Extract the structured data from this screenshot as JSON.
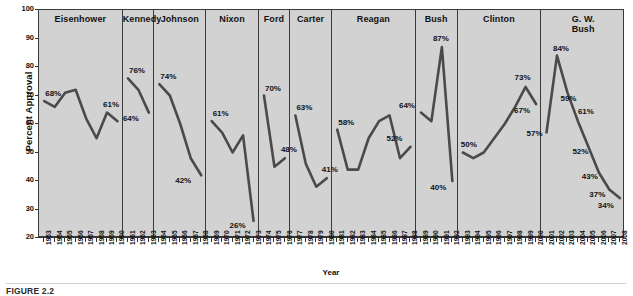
{
  "figure": {
    "caption": "FIGURE 2.2",
    "ylabel": "Percent Approval",
    "xlabel": "Year"
  },
  "chart_data": {
    "type": "line",
    "title": "",
    "xlabel": "Year",
    "ylabel": "Percent Approval",
    "ylim": [
      20,
      100
    ],
    "yticks": [
      20,
      30,
      40,
      50,
      60,
      70,
      80,
      90,
      100
    ],
    "xlim": [
      1953,
      2008
    ],
    "grid": false,
    "legend": "none",
    "panel_label_position": "top-center",
    "x": [
      1953,
      1954,
      1955,
      1956,
      1957,
      1958,
      1959,
      1960,
      1961,
      1962,
      1963,
      1964,
      1965,
      1966,
      1967,
      1968,
      1969,
      1970,
      1971,
      1972,
      1973,
      1974,
      1975,
      1976,
      1977,
      1978,
      1979,
      1980,
      1981,
      1982,
      1983,
      1984,
      1985,
      1986,
      1987,
      1988,
      1989,
      1990,
      1991,
      1992,
      1993,
      1994,
      1995,
      1996,
      1997,
      1998,
      1999,
      2000,
      2001,
      2002,
      2003,
      2004,
      2005,
      2006,
      2007,
      2008
    ],
    "panels": [
      {
        "name": "Eisenhower",
        "years": [
          1953,
          1954,
          1955,
          1956,
          1957,
          1958,
          1959,
          1960
        ],
        "values": [
          68,
          66,
          71,
          72,
          62,
          55,
          64,
          61
        ],
        "annotations": [
          {
            "year": 1953,
            "value": 68,
            "text": "68%"
          },
          {
            "year": 1959,
            "value": 64,
            "text": "61%"
          }
        ]
      },
      {
        "name": "Kennedy",
        "years": [
          1961,
          1962,
          1963
        ],
        "values": [
          76,
          72,
          64
        ],
        "annotations": [
          {
            "year": 1961,
            "value": 76,
            "text": "76%"
          },
          {
            "year": 1963,
            "value": 64,
            "text": "64%"
          }
        ]
      },
      {
        "name": "Johnson",
        "years": [
          1964,
          1965,
          1966,
          1967,
          1968
        ],
        "values": [
          74,
          70,
          60,
          48,
          42
        ],
        "annotations": [
          {
            "year": 1964,
            "value": 74,
            "text": "74%"
          },
          {
            "year": 1968,
            "value": 42,
            "text": "42%"
          }
        ]
      },
      {
        "name": "Nixon",
        "years": [
          1969,
          1970,
          1971,
          1972,
          1973
        ],
        "values": [
          61,
          57,
          50,
          56,
          26
        ],
        "annotations": [
          {
            "year": 1969,
            "value": 61,
            "text": "61%"
          },
          {
            "year": 1973,
            "value": 26,
            "text": "26%"
          }
        ]
      },
      {
        "name": "Ford",
        "years": [
          1974,
          1975,
          1976
        ],
        "values": [
          70,
          45,
          48
        ],
        "annotations": [
          {
            "year": 1974,
            "value": 70,
            "text": "70%"
          },
          {
            "year": 1976,
            "value": 48,
            "text": "48%"
          }
        ]
      },
      {
        "name": "Carter",
        "years": [
          1977,
          1978,
          1979,
          1980
        ],
        "values": [
          63,
          46,
          38,
          41
        ],
        "annotations": [
          {
            "year": 1977,
            "value": 63,
            "text": "63%"
          },
          {
            "year": 1980,
            "value": 41,
            "text": "41%"
          }
        ]
      },
      {
        "name": "Reagan",
        "years": [
          1981,
          1982,
          1983,
          1984,
          1985,
          1986,
          1987,
          1988
        ],
        "values": [
          58,
          44,
          44,
          55,
          61,
          63,
          48,
          52
        ],
        "annotations": [
          {
            "year": 1981,
            "value": 58,
            "text": "58%"
          },
          {
            "year": 1988,
            "value": 52,
            "text": "52%"
          }
        ]
      },
      {
        "name": "Bush",
        "years": [
          1989,
          1990,
          1991,
          1992
        ],
        "values": [
          64,
          61,
          87,
          40
        ],
        "annotations": [
          {
            "year": 1989,
            "value": 64,
            "text": "64%"
          },
          {
            "year": 1991,
            "value": 87,
            "text": "87%"
          },
          {
            "year": 1992,
            "value": 40,
            "text": "40%"
          }
        ]
      },
      {
        "name": "Clinton",
        "years": [
          1993,
          1994,
          1995,
          1996,
          1997,
          1998,
          1999,
          2000
        ],
        "values": [
          50,
          48,
          50,
          55,
          60,
          66,
          73,
          67
        ],
        "annotations": [
          {
            "year": 1993,
            "value": 50,
            "text": "50%"
          },
          {
            "year": 1999,
            "value": 73,
            "text": "73%"
          },
          {
            "year": 2000,
            "value": 67,
            "text": "67%"
          }
        ]
      },
      {
        "name": "G. W.\nBush",
        "years": [
          2001,
          2002,
          2003,
          2004,
          2005,
          2006,
          2007,
          2008
        ],
        "values": [
          57,
          84,
          71,
          61,
          52,
          43,
          37,
          34
        ],
        "annotations": [
          {
            "year": 2001,
            "value": 57,
            "text": "57%"
          },
          {
            "year": 2002,
            "value": 84,
            "text": "84%"
          },
          {
            "year": 2003,
            "value": 71,
            "text": "59%"
          },
          {
            "year": 2004,
            "value": 61,
            "text": "61%"
          },
          {
            "year": 2005,
            "value": 52,
            "text": "52%"
          },
          {
            "year": 2006,
            "value": 43,
            "text": "43%"
          },
          {
            "year": 2007,
            "value": 37,
            "text": "37%"
          },
          {
            "year": 2008,
            "value": 34,
            "text": "34%"
          }
        ]
      }
    ],
    "colors": {
      "line": "#4a4a4a",
      "panel_bg": "#d2d2d2",
      "axis": "#333333",
      "text": "#111111"
    }
  }
}
